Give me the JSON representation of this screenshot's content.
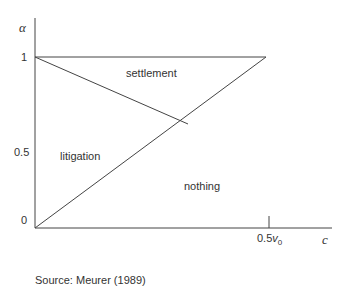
{
  "diagram": {
    "y_axis_label": "α",
    "x_axis_label": "c",
    "y_ticks": [
      "1",
      "0.5",
      "0"
    ],
    "x_tick_main": "0.5",
    "x_tick_var": "v",
    "x_tick_sub": "0",
    "regions": {
      "settlement": "settlement",
      "litigation": "litigation",
      "nothing": "nothing"
    },
    "line_color": "#333333"
  },
  "source": "Source: Meurer (1989)"
}
